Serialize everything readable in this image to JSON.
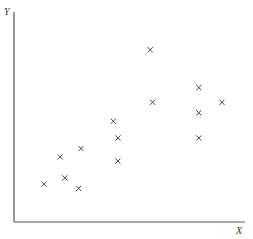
{
  "chart_data": {
    "type": "scatter",
    "title": "",
    "xlabel": "X",
    "ylabel": "Y",
    "xlim": [
      0,
      10
    ],
    "ylim": [
      0,
      10
    ],
    "grid": false,
    "legend": null,
    "marker": "x",
    "x": [
      1.3,
      2.2,
      2.8,
      2.0,
      2.9,
      4.3,
      4.5,
      4.5,
      5.9,
      6.0,
      8.0,
      8.0,
      8.0,
      9.0
    ],
    "y": [
      1.8,
      2.1,
      1.6,
      3.1,
      3.5,
      4.8,
      4.0,
      2.9,
      8.2,
      5.7,
      6.4,
      5.2,
      4.0,
      5.7
    ],
    "colors": {
      "axis": "#555555",
      "marker": "#444444"
    }
  }
}
